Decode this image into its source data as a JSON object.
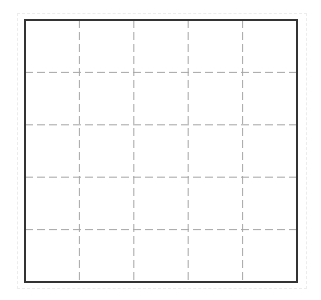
{
  "diagram": {
    "type": "grid",
    "rows": 5,
    "columns": 5,
    "border": {
      "x": 25,
      "y": 20,
      "width": 272,
      "height": 262,
      "color": "#333333",
      "stroke_width": 2
    },
    "grid_lines": {
      "style": "dashed",
      "color": "#a6a6a6",
      "dash": "8,4",
      "vertical_x": [
        79.4,
        133.8,
        188.2,
        242.6
      ],
      "horizontal_y": [
        72.4,
        124.8,
        177.2,
        229.6
      ]
    },
    "outer_frame": {
      "color": "#ececec",
      "style": "dashed"
    }
  }
}
